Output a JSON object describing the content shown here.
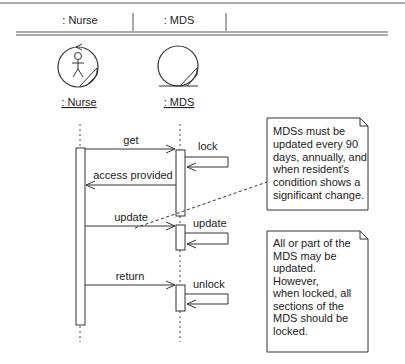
{
  "header": {
    "columns": [
      ": Nurse",
      ": MDS"
    ]
  },
  "objects": [
    {
      "name": ": Nurse",
      "kind": "control-actor"
    },
    {
      "name": ": MDS",
      "kind": "entity"
    }
  ],
  "messages": [
    {
      "label": "get",
      "from": ": Nurse",
      "to": ": MDS"
    },
    {
      "label": "lock",
      "from": ": MDS",
      "to": ": MDS"
    },
    {
      "label": "access provided",
      "from": ": MDS",
      "to": ": Nurse"
    },
    {
      "label": "update",
      "from": ": Nurse",
      "to": ": MDS"
    },
    {
      "label": "update",
      "from": ": MDS",
      "to": ": MDS"
    },
    {
      "label": "return",
      "from": ": Nurse",
      "to": ": MDS"
    },
    {
      "label": "unlock",
      "from": ": MDS",
      "to": ": MDS"
    }
  ],
  "notes": [
    {
      "lines": [
        "MDSs must be",
        "updated every 90",
        "days, annually, and",
        "when resident's",
        "condition shows a",
        "significant change."
      ]
    },
    {
      "lines": [
        "All or part of the",
        "MDS may be",
        "updated.",
        "However,",
        "when locked, all",
        "sections of the",
        "MDS should be",
        "locked."
      ]
    }
  ],
  "colors": {
    "stroke": "#333333",
    "background": "#ffffff"
  }
}
